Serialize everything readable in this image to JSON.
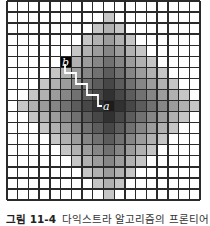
{
  "figure": {
    "grid": {
      "cols": 18,
      "rows": 18,
      "origin_x": 7,
      "origin_y": 1,
      "width": 193,
      "height": 199,
      "line_color": "#2a2a2a",
      "background": "#ffffff"
    },
    "frontier": {
      "shape": "manhattan-diamond",
      "center_col": 9,
      "center_row": 9,
      "radius": 8,
      "color_center": "#1c1c1c",
      "color_edge": "#c6c6c6"
    },
    "nodes": [
      {
        "id": "b",
        "label": "b",
        "col": 5,
        "row": 5,
        "fill": "#000000",
        "text_x": 62,
        "text_y": 57
      },
      {
        "id": "a",
        "label": "a",
        "col": 9,
        "row": 9,
        "fill": null,
        "text_x": 103,
        "text_y": 101
      }
    ],
    "path": {
      "color": "#ffffff",
      "points": [
        [
          65,
          64
        ],
        [
          65,
          73
        ],
        [
          76,
          73
        ],
        [
          76,
          84
        ],
        [
          87,
          84
        ],
        [
          87,
          95
        ],
        [
          98,
          95
        ],
        [
          98,
          106
        ],
        [
          102,
          106
        ]
      ]
    },
    "caption": {
      "number": "그림 11-4",
      "text": "다익스트라 알고리즘의 프론티어 방울"
    }
  }
}
